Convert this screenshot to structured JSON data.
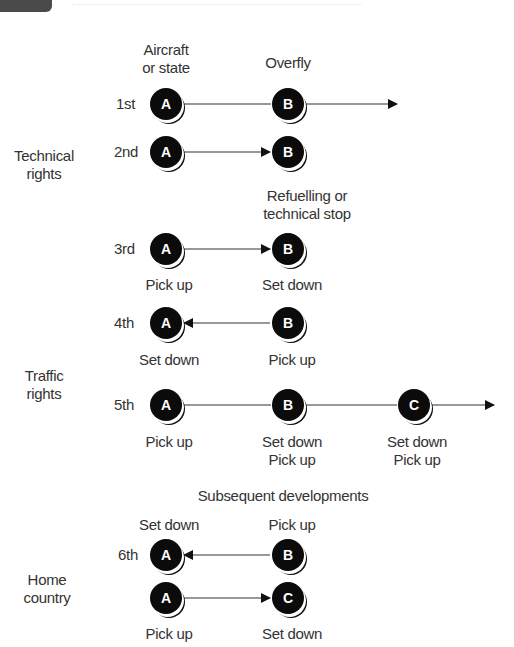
{
  "diagram": {
    "column_headers": {
      "origin": "Aircraft\nor state",
      "overfly": "Overfly"
    },
    "groups": [
      {
        "label": "Technical\nrights"
      },
      {
        "label": "Traffic\nrights"
      },
      {
        "label": "Home\ncountry"
      }
    ],
    "section_header": "Subsequent developments",
    "rows": [
      {
        "freedom": "1st",
        "nodes": [
          "A",
          "B"
        ],
        "direction": "A→B→beyond",
        "labels": {
          "above_b": "Overfly"
        }
      },
      {
        "freedom": "2nd",
        "nodes": [
          "A",
          "B"
        ],
        "direction": "A→B",
        "labels": {
          "below_b": "Refuelling or\ntechnical stop"
        }
      },
      {
        "freedom": "3rd",
        "nodes": [
          "A",
          "B"
        ],
        "direction": "A→B",
        "labels": {
          "below_a": "Pick up",
          "below_b": "Set down"
        }
      },
      {
        "freedom": "4th",
        "nodes": [
          "A",
          "B"
        ],
        "direction": "B→A",
        "labels": {
          "below_a": "Set down",
          "below_b": "Pick up"
        }
      },
      {
        "freedom": "5th",
        "nodes": [
          "A",
          "B",
          "C"
        ],
        "direction": "A→B→C→beyond",
        "labels": {
          "below_a": "Pick up",
          "below_b": "Set down\nPick up",
          "below_c": "Set down\nPick up"
        }
      },
      {
        "freedom": "6th",
        "nodes": [
          "A",
          "B"
        ],
        "direction": "B→A",
        "labels": {
          "above_a": "Set down",
          "above_b": "Pick up"
        }
      },
      {
        "freedom": "",
        "nodes": [
          "A",
          "C"
        ],
        "direction": "A→C",
        "labels": {
          "below_a": "Pick up",
          "below_c": "Set down"
        }
      }
    ],
    "colors": {
      "node_fill": "#0b0b0b",
      "node_text": "#ffffff",
      "line": "#222222",
      "text": "#333333"
    }
  }
}
